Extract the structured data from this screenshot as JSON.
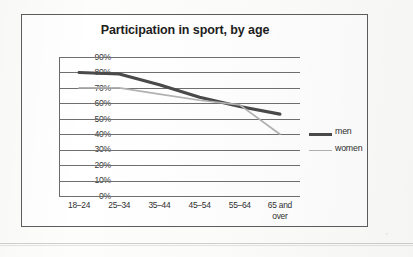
{
  "chart_data": {
    "type": "line",
    "title": "Participation in sport, by age",
    "xlabel": "",
    "ylabel": "",
    "categories": [
      "18–24",
      "25–34",
      "35–44",
      "45–54",
      "55–64",
      "65 and over"
    ],
    "category_lines": [
      [
        "18–24"
      ],
      [
        "25–34"
      ],
      [
        "35–44"
      ],
      [
        "45–54"
      ],
      [
        "55–64"
      ],
      [
        "65 and",
        "over"
      ]
    ],
    "series": [
      {
        "name": "men",
        "values": [
          80,
          79,
          72,
          64,
          58,
          53
        ],
        "color": "#4a4a4a",
        "width": 3.1
      },
      {
        "name": "women",
        "values": [
          70,
          70,
          66,
          62,
          59,
          40
        ],
        "color": "#b2b2b2",
        "width": 1.7
      }
    ],
    "ylim": [
      0,
      90
    ],
    "ytick_values": [
      90,
      80,
      70,
      60,
      50,
      40,
      30,
      20,
      10,
      0
    ],
    "ytick_labels": [
      "90%",
      "80%",
      "70%",
      "60%",
      "50%",
      "40%",
      "30%",
      "20%",
      "10%",
      "0%"
    ],
    "grid": true,
    "grid_axis": "y",
    "legend_position": "right",
    "units": "percent"
  },
  "legend": {
    "entries": [
      {
        "label": "men"
      },
      {
        "label": "women"
      }
    ]
  },
  "colors": {
    "men_line": "#4a4a4a",
    "women_line": "#b2b2b2",
    "gridline": "#6f6f6f",
    "frame": "#5d5d5d",
    "title_text": "#1d1d1d",
    "tick_text": "#313131",
    "page_background": "#fdfdfc"
  }
}
